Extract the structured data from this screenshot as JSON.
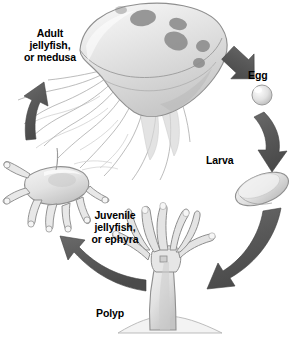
{
  "diagram": {
    "background_color": "#ffffff",
    "text_color": "#000000",
    "arrow_color": "#5b5b5b",
    "organism_fill": "#e9e9e9",
    "organism_stroke": "#8d8d8d"
  },
  "stages": [
    {
      "id": "adult",
      "label_line1": "Adult",
      "label_line2": "jellyfish,",
      "label_line3": "or medusa",
      "icon": "medusa-jellyfish-icon"
    },
    {
      "id": "egg",
      "label_line1": "Egg",
      "icon": "egg-icon"
    },
    {
      "id": "larva",
      "label_line1": "Larva",
      "icon": "planula-larva-icon"
    },
    {
      "id": "polyp",
      "label_line1": "Polyp",
      "icon": "polyp-icon"
    },
    {
      "id": "juvenile",
      "label_line1": "Juvenile",
      "label_line2": "jellyfish,",
      "label_line3": "or ephyra",
      "icon": "ephyra-icon"
    }
  ],
  "arrows": [
    {
      "id": "adult-to-egg",
      "from": "adult",
      "to": "egg",
      "direction": "down-right"
    },
    {
      "id": "egg-to-larva",
      "from": "egg",
      "to": "larva",
      "direction": "down"
    },
    {
      "id": "larva-to-polyp",
      "from": "larva",
      "to": "polyp",
      "direction": "down-left"
    },
    {
      "id": "polyp-to-juvenile",
      "from": "polyp",
      "to": "juvenile",
      "direction": "up-left"
    },
    {
      "id": "juvenile-to-adult",
      "from": "juvenile",
      "to": "adult",
      "direction": "up"
    }
  ]
}
